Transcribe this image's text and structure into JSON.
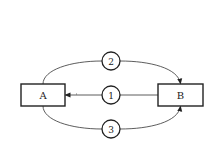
{
  "diagram": {
    "nodes": {
      "a": {
        "label": "A",
        "shape": "rectangle"
      },
      "b": {
        "label": "B",
        "shape": "rectangle"
      },
      "c1": {
        "label": "1",
        "shape": "circle"
      },
      "c2": {
        "label": "2",
        "shape": "circle"
      },
      "c3": {
        "label": "3",
        "shape": "circle"
      }
    },
    "edges": [
      {
        "id": "e1",
        "from": "B",
        "to": "A",
        "via": "1",
        "style": "straight",
        "arrow": "into A"
      },
      {
        "id": "e2",
        "from": "A",
        "to": "B",
        "via": "2",
        "style": "curved-top",
        "arrow": "into B"
      },
      {
        "id": "e3",
        "from": "A",
        "to": "B",
        "via": "3",
        "style": "curved-bottom",
        "arrow": "into B"
      }
    ],
    "colors": {
      "stroke": "#222222",
      "background": "#ffffff"
    }
  }
}
